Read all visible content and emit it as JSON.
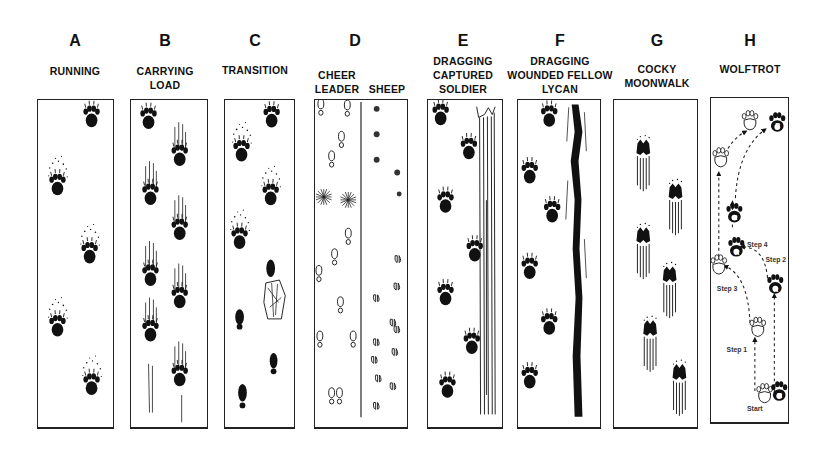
{
  "figure": {
    "type": "track-pattern-comparison",
    "panels": [
      {
        "id": "A",
        "letter": "A",
        "caption": [
          "RUNNING"
        ]
      },
      {
        "id": "B",
        "letter": "B",
        "caption": [
          "CARRYING",
          "LOAD"
        ]
      },
      {
        "id": "C",
        "letter": "C",
        "caption": [
          "TRANSITION"
        ]
      },
      {
        "id": "D",
        "letter": "D",
        "caption_left": [
          "CHEER",
          "LEADER"
        ],
        "caption_right": "SHEEP"
      },
      {
        "id": "E",
        "letter": "E",
        "caption": [
          "DRAGGING",
          "CAPTURED",
          "SOLDIER"
        ]
      },
      {
        "id": "F",
        "letter": "F",
        "caption": [
          "DRAGGING",
          "WOUNDED FELLOW",
          "LYCAN"
        ]
      },
      {
        "id": "G",
        "letter": "G",
        "caption": [
          "COCKY",
          "MOONWALK"
        ]
      },
      {
        "id": "H",
        "letter": "H",
        "caption": [
          "WOLFTROT"
        ],
        "annotations": {
          "start": "Start",
          "step1": "Step 1",
          "step2": "Step 2",
          "step3": "Step 3",
          "step4": "Step 4",
          "left_marker": "L",
          "right_marker": "R"
        }
      }
    ]
  },
  "colors": {
    "ink": "#111111",
    "paper": "#ffffff",
    "border": "#222222"
  }
}
